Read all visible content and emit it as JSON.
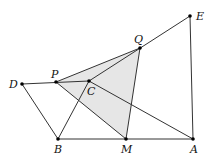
{
  "diagram": {
    "type": "geometry",
    "points": [
      {
        "name": "E",
        "x": 190,
        "y": 16,
        "lx": 196,
        "ly": 20
      },
      {
        "name": "Q",
        "x": 140,
        "y": 48,
        "lx": 134,
        "ly": 43
      },
      {
        "name": "P",
        "x": 56,
        "y": 82,
        "lx": 51,
        "ly": 78
      },
      {
        "name": "C",
        "x": 89,
        "y": 81,
        "lx": 87,
        "ly": 95
      },
      {
        "name": "D",
        "x": 22,
        "y": 84,
        "lx": 9,
        "ly": 88
      },
      {
        "name": "B",
        "x": 58,
        "y": 139,
        "lx": 54,
        "ly": 153
      },
      {
        "name": "M",
        "x": 126,
        "y": 139,
        "lx": 121,
        "ly": 153
      },
      {
        "name": "A",
        "x": 193,
        "y": 139,
        "lx": 190,
        "ly": 153
      }
    ],
    "segments": [
      [
        "D",
        "C"
      ],
      [
        "C",
        "E"
      ],
      [
        "P",
        "Q"
      ],
      [
        "Q",
        "M"
      ],
      [
        "P",
        "M"
      ],
      [
        "C",
        "A"
      ],
      [
        "C",
        "B"
      ],
      [
        "D",
        "B"
      ],
      [
        "B",
        "A"
      ],
      [
        "A",
        "E"
      ]
    ],
    "shaded_polygon": [
      "P",
      "Q",
      "M"
    ],
    "fill_color": "#e6e6e6",
    "line_color": "#333333"
  }
}
